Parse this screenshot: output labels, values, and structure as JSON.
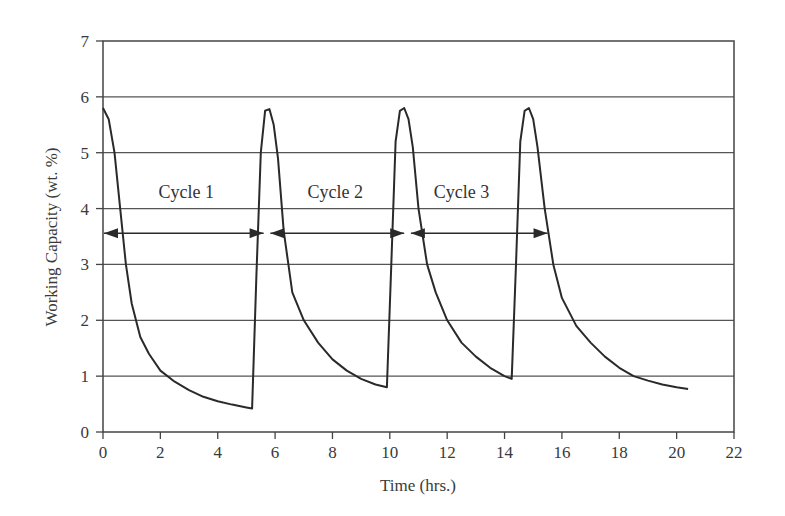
{
  "chart_data": {
    "type": "line",
    "title": "",
    "xlabel": "Time (hrs.)",
    "ylabel": "Working Capacity (wt. %)",
    "xlim": [
      0,
      22
    ],
    "ylim": [
      0,
      7
    ],
    "xticks": [
      0,
      2,
      4,
      6,
      8,
      10,
      12,
      14,
      16,
      18,
      20,
      22
    ],
    "yticks": [
      0,
      1,
      2,
      3,
      4,
      5,
      6,
      7
    ],
    "grid": {
      "horizontal": true,
      "vertical": false
    },
    "legend": null,
    "series": [
      {
        "name": "Working Capacity",
        "x": [
          0.0,
          0.2,
          0.4,
          0.6,
          0.8,
          1.0,
          1.3,
          1.6,
          2.0,
          2.5,
          3.0,
          3.5,
          4.0,
          4.5,
          5.0,
          5.2,
          5.35,
          5.5,
          5.65,
          5.8,
          5.95,
          6.1,
          6.3,
          6.6,
          7.0,
          7.5,
          8.0,
          8.5,
          9.0,
          9.5,
          9.9,
          10.05,
          10.2,
          10.35,
          10.5,
          10.65,
          10.8,
          11.0,
          11.3,
          11.6,
          12.0,
          12.5,
          13.0,
          13.5,
          14.0,
          14.25,
          14.4,
          14.55,
          14.7,
          14.85,
          15.0,
          15.15,
          15.4,
          15.7,
          16.0,
          16.5,
          17.0,
          17.5,
          18.0,
          18.5,
          19.0,
          19.5,
          20.0,
          20.4
        ],
        "y": [
          5.8,
          5.6,
          5.0,
          4.0,
          3.0,
          2.3,
          1.7,
          1.4,
          1.1,
          0.9,
          0.75,
          0.63,
          0.55,
          0.49,
          0.44,
          0.42,
          2.8,
          5.0,
          5.75,
          5.78,
          5.5,
          4.9,
          3.6,
          2.5,
          2.0,
          1.6,
          1.3,
          1.1,
          0.95,
          0.85,
          0.8,
          3.0,
          5.2,
          5.75,
          5.8,
          5.6,
          5.1,
          4.0,
          3.0,
          2.5,
          2.0,
          1.6,
          1.35,
          1.15,
          1.0,
          0.95,
          3.0,
          5.2,
          5.75,
          5.8,
          5.6,
          5.1,
          4.0,
          3.0,
          2.4,
          1.9,
          1.6,
          1.35,
          1.15,
          1.0,
          0.92,
          0.85,
          0.8,
          0.77
        ]
      }
    ],
    "annotations": [
      {
        "text": "Cycle 1",
        "x_center": 2.9,
        "y": 4.3,
        "arrow_from": 0.0,
        "arrow_to": 5.6,
        "arrow_y": 3.56
      },
      {
        "text": "Cycle 2",
        "x_center": 8.1,
        "y": 4.3,
        "arrow_from": 5.8,
        "arrow_to": 10.5,
        "arrow_y": 3.56
      },
      {
        "text": "Cycle 3",
        "x_center": 12.5,
        "y": 4.3,
        "arrow_from": 10.7,
        "arrow_to": 15.5,
        "arrow_y": 3.56
      }
    ]
  },
  "colors": {
    "line": "#2a2a2a",
    "grid": "#555555",
    "axis": "#444444",
    "text": "#3a3a3a"
  }
}
